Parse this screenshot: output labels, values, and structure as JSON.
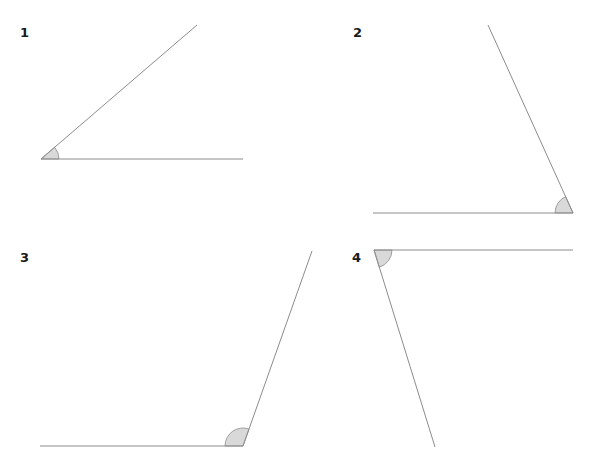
{
  "diagram": {
    "type": "angle-identification-exercise",
    "style": {
      "line_color": "#8c8c8c",
      "arc_fill": "#d9d9d9",
      "label_color": "#1a1a1a",
      "background": "#ffffff"
    },
    "angles": [
      {
        "label": "1",
        "label_pos": [
          20,
          37
        ],
        "vertex": [
          41,
          159
        ],
        "ray_a": [
          243,
          159
        ],
        "ray_b": [
          197,
          25
        ],
        "arc_radius": 18,
        "kind": "acute"
      },
      {
        "label": "2",
        "label_pos": [
          353,
          37
        ],
        "vertex": [
          573,
          213
        ],
        "ray_a": [
          373,
          213
        ],
        "ray_b": [
          488,
          25
        ],
        "arc_radius": 18,
        "kind": "acute"
      },
      {
        "label": "3",
        "label_pos": [
          20,
          262
        ],
        "vertex": [
          243,
          446
        ],
        "ray_a": [
          40,
          446
        ],
        "ray_b": [
          312,
          251
        ],
        "arc_radius": 18,
        "kind": "obtuse"
      },
      {
        "label": "4",
        "label_pos": [
          352,
          262
        ],
        "vertex": [
          374,
          250
        ],
        "ray_a": [
          573,
          250
        ],
        "ray_b": [
          435,
          447
        ],
        "arc_radius": 18,
        "kind": "acute"
      }
    ]
  }
}
